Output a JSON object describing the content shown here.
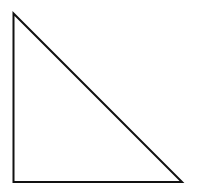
{
  "diagram": {
    "shape": "right-triangle",
    "stroke_color": "#111111",
    "fill_color": "#ffffff",
    "stroke_width": 2,
    "vertices": [
      {
        "x": 13.5,
        "y": 13.5
      },
      {
        "x": 13.5,
        "y": 182
      },
      {
        "x": 182,
        "y": 182
      }
    ]
  }
}
